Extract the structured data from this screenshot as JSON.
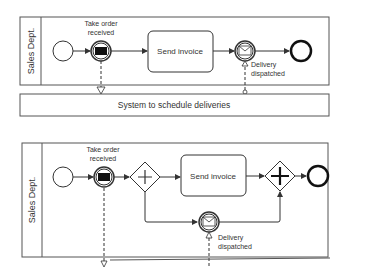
{
  "diagram1": {
    "lane_label": "Sales Dept.",
    "event_take_order": "Take order",
    "event_take_order_2": "received",
    "task": "Send invoice",
    "event_delivery": "Delivery",
    "event_delivery_2": "dispatched",
    "external_pool": "System to schedule deliveries"
  },
  "diagram2": {
    "lane_label": "Sales Dept.",
    "event_take_order": "Take order",
    "event_take_order_2": "received",
    "task": "Send invoice",
    "event_delivery": "Delivery",
    "event_delivery_2": "dispatched"
  },
  "colors": {
    "stroke": "#333333",
    "text": "#333333",
    "background": "#ffffff"
  }
}
